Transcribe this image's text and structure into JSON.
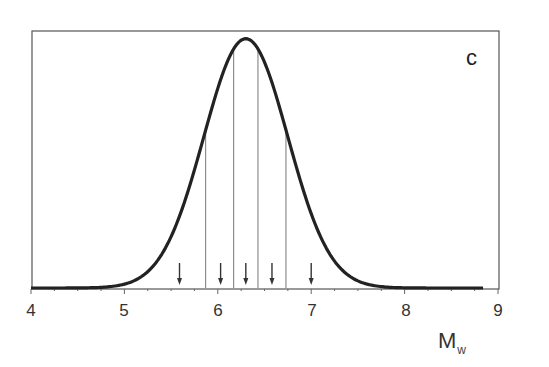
{
  "chart_data": {
    "type": "line",
    "title": "",
    "panel_label": "c",
    "xlabel": "M",
    "xlabel_subscript": "w",
    "ylabel": "",
    "xlim": [
      4,
      9
    ],
    "ylim": [
      0,
      1.0
    ],
    "x_ticks": [
      4,
      5,
      6,
      7,
      8,
      9
    ],
    "x_tick_labels": [
      "4",
      "5",
      "6",
      "7",
      "8",
      "9"
    ],
    "x_minor_tick_step": 0.25,
    "grid": false,
    "legend": null,
    "series": [
      {
        "name": "Mw distribution",
        "kind": "gaussian",
        "mean": 6.3,
        "sigma": 0.45,
        "x_start": 4.0,
        "x_end": 8.85,
        "peak_relative_height": 0.97,
        "color": "#222222"
      }
    ],
    "vertical_lines": [
      5.87,
      6.17,
      6.43,
      6.73
    ],
    "arrows": [
      5.59,
      6.03,
      6.3,
      6.58,
      7.0
    ]
  },
  "labels": {
    "panel": "c",
    "x_title": "M",
    "x_title_sub": "w",
    "ticks": [
      "4",
      "5",
      "6",
      "7",
      "8",
      "9"
    ]
  }
}
